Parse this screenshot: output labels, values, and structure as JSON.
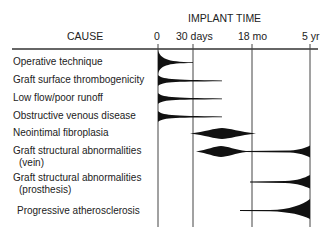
{
  "header": {
    "cause_label": "CAUSE",
    "implant_time_label": "IMPLANT TIME",
    "time_ticks": [
      {
        "label": "0",
        "x": 158
      },
      {
        "label": "30 days",
        "x": 193
      },
      {
        "label": "18 mo",
        "x": 252
      },
      {
        "label": "5 yr",
        "x": 310
      }
    ]
  },
  "causes": [
    {
      "label": "Operative technique",
      "shape": "early-decay",
      "start": "0",
      "end": "30 days",
      "peak": "0"
    },
    {
      "label": "Graft surface thrombogenicity",
      "shape": "early-decay",
      "start": "0",
      "end": "~9 mo",
      "peak": "0"
    },
    {
      "label": "Low flow/poor runoff",
      "shape": "early-decay",
      "start": "0",
      "end": "~9 mo",
      "peak": "0"
    },
    {
      "label": "Obstructive venous disease",
      "shape": "early-decay",
      "start": "0",
      "end": "~9 mo",
      "peak": "0"
    },
    {
      "label": "Neointimal fibroplasia",
      "shape": "diamond",
      "start": "~30 days",
      "end": "~18 mo",
      "peak": "~9 mo"
    },
    {
      "label": "Graft structural abnormalities",
      "label_line2": "(vein)",
      "shape": "diamond-then-late-rise",
      "start": "~30 days",
      "end": "5 yr",
      "peak": "~9 mo and 5 yr"
    },
    {
      "label": "Graft structural abnormalities",
      "label_line2": "(prosthesis)",
      "shape": "late-rise",
      "start": "18 mo",
      "end": "5 yr",
      "peak": "5 yr"
    },
    {
      "label": "Progressive atherosclerosis",
      "shape": "late-rise",
      "start": "~1 yr",
      "end": "5 yr",
      "peak": "5 yr"
    }
  ],
  "colors": {
    "ink": "#111111",
    "axis": "#333333",
    "text": "#222222"
  }
}
